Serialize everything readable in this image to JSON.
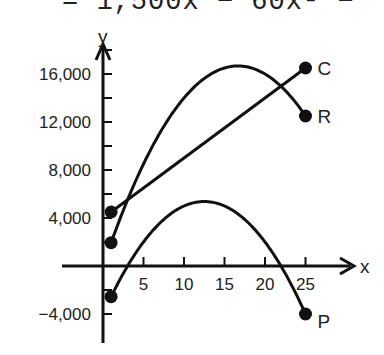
{
  "header": {
    "equation_fragment": "= 1,500x − 60x² −"
  },
  "chart_data": {
    "type": "line",
    "title": "",
    "xlabel": "x",
    "ylabel": "y",
    "xlim": [
      0,
      28
    ],
    "ylim": [
      -5000,
      18000
    ],
    "x_ticks": [
      5,
      10,
      15,
      20,
      25
    ],
    "x_tick_labels": [
      "5",
      "10",
      "15",
      "20",
      "25"
    ],
    "y_ticks": [
      -4000,
      4000,
      8000,
      12000,
      16000
    ],
    "y_tick_labels": [
      "−4,000",
      "4,000",
      "8,000",
      "12,000",
      "16,000"
    ],
    "grid": false,
    "legend": "endpoint labels",
    "series": [
      {
        "name": "C",
        "label": "C",
        "kind": "linear",
        "x": [
          1,
          25
        ],
        "values": [
          4500,
          16500
        ],
        "formula": "4000 + 500x"
      },
      {
        "name": "R",
        "label": "R",
        "kind": "quadratic",
        "x": [
          1,
          5,
          10,
          15,
          16.7,
          20,
          25
        ],
        "values": [
          1940,
          8500,
          14000,
          16500,
          16667,
          16000,
          12500
        ],
        "formula": "2000x − 60x²"
      },
      {
        "name": "P",
        "label": "P",
        "kind": "quadratic",
        "x": [
          1,
          5,
          10,
          12.5,
          15,
          20,
          25
        ],
        "values": [
          -2560,
          2000,
          5000,
          5375,
          5000,
          2000,
          -4000
        ],
        "formula": "1500x − 60x² − 4000"
      }
    ]
  }
}
